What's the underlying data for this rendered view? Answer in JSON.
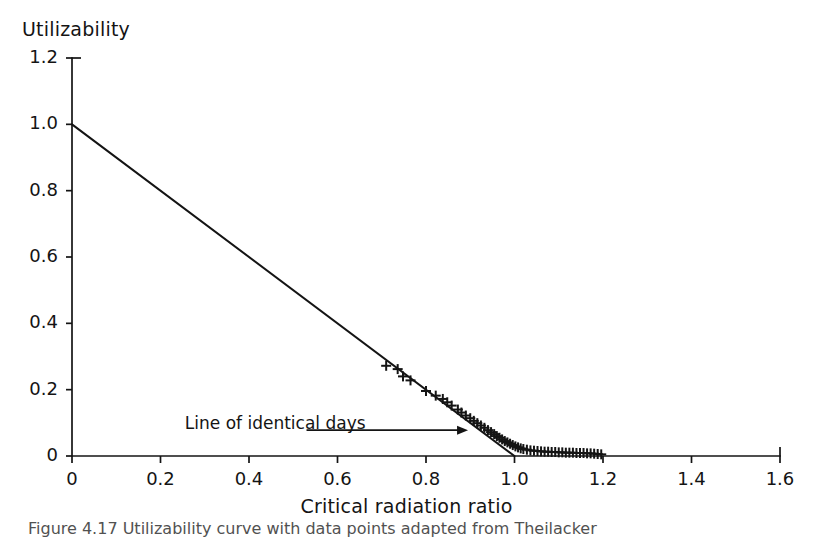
{
  "figure": {
    "caption": "Figure 4.17 Utilizability curve with data points adapted from Theilacker",
    "background_color": "#ffffff",
    "ink_color": "#141414"
  },
  "chart_data": {
    "type": "scatter",
    "title": "",
    "ylabel": "Utilizability",
    "xlabel": "Critical radiation ratio",
    "xlim": [
      0,
      1.6
    ],
    "ylim": [
      0,
      1.2
    ],
    "grid": false,
    "legend_position": "none",
    "xticks": [
      0,
      0.2,
      0.4,
      0.6,
      0.8,
      1.0,
      1.2,
      1.4,
      1.6
    ],
    "xtick_labels": [
      "0",
      "0.2",
      "0.4",
      "0.6",
      "0.8",
      "1.0",
      "1.2",
      "1.4",
      "1.6"
    ],
    "yticks": [
      0,
      0.2,
      0.4,
      0.6,
      0.8,
      1.0,
      1.2
    ],
    "ytick_labels": [
      "0",
      "0.2",
      "0.4",
      "0.6",
      "0.8",
      "1.0",
      "1.2"
    ],
    "series": [
      {
        "name": "Line of identical days",
        "type": "line",
        "marker": "none",
        "x": [
          0,
          1.0
        ],
        "y": [
          1.0,
          0
        ]
      },
      {
        "name": "Measured days",
        "type": "scatter",
        "marker": "plus",
        "points": [
          [
            0.71,
            0.272
          ],
          [
            0.736,
            0.262
          ],
          [
            0.748,
            0.24
          ],
          [
            0.765,
            0.228
          ],
          [
            0.8,
            0.196
          ],
          [
            0.822,
            0.182
          ],
          [
            0.838,
            0.172
          ],
          [
            0.848,
            0.162
          ],
          [
            0.858,
            0.152
          ],
          [
            0.872,
            0.14
          ],
          [
            0.88,
            0.131
          ],
          [
            0.89,
            0.122
          ],
          [
            0.9,
            0.114
          ],
          [
            0.908,
            0.106
          ],
          [
            0.916,
            0.099
          ],
          [
            0.924,
            0.092
          ],
          [
            0.932,
            0.085
          ],
          [
            0.94,
            0.078
          ],
          [
            0.947,
            0.072
          ],
          [
            0.954,
            0.066
          ],
          [
            0.96,
            0.06
          ],
          [
            0.966,
            0.055
          ],
          [
            0.972,
            0.05
          ],
          [
            0.978,
            0.045
          ],
          [
            0.984,
            0.041
          ],
          [
            0.99,
            0.037
          ],
          [
            0.996,
            0.033
          ],
          [
            1.002,
            0.029
          ],
          [
            1.008,
            0.026
          ],
          [
            1.014,
            0.023
          ],
          [
            1.02,
            0.021
          ],
          [
            1.028,
            0.019
          ],
          [
            1.036,
            0.017
          ],
          [
            1.044,
            0.016
          ],
          [
            1.052,
            0.015
          ],
          [
            1.06,
            0.014
          ],
          [
            1.068,
            0.013
          ],
          [
            1.076,
            0.013
          ],
          [
            1.084,
            0.012
          ],
          [
            1.092,
            0.012
          ],
          [
            1.1,
            0.011
          ],
          [
            1.108,
            0.011
          ],
          [
            1.116,
            0.01
          ],
          [
            1.124,
            0.01
          ],
          [
            1.132,
            0.01
          ],
          [
            1.14,
            0.009
          ],
          [
            1.148,
            0.009
          ],
          [
            1.156,
            0.009
          ],
          [
            1.164,
            0.008
          ],
          [
            1.172,
            0.008
          ],
          [
            1.18,
            0.007
          ],
          [
            1.188,
            0.006
          ],
          [
            1.196,
            0.005
          ]
        ]
      }
    ],
    "annotations": [
      {
        "text": "Line of identical days",
        "text_x": 0.255,
        "text_y": 0.095,
        "arrow_from_x": 0.53,
        "arrow_from_y": 0.078,
        "arrow_to_x": 0.895,
        "arrow_to_y": 0.078
      }
    ]
  }
}
